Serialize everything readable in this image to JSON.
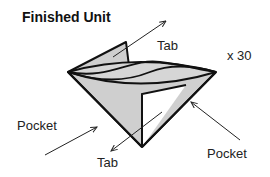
{
  "title": "Finished Unit",
  "labels": {
    "tab_top": "Tab",
    "tab_bottom": "Tab",
    "pocket_left": "Pocket",
    "pocket_right": "Pocket",
    "multiplier": "x 30"
  },
  "colors": {
    "fill": "#cfcfcf",
    "stroke": "#111111",
    "background": "#ffffff"
  }
}
